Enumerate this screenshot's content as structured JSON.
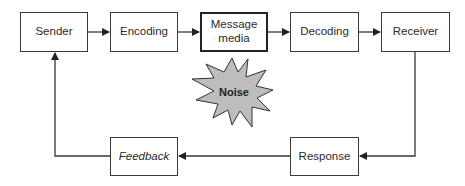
{
  "diagram": {
    "nodes": [
      {
        "id": "sender",
        "label": "Sender"
      },
      {
        "id": "encoding",
        "label": "Encoding"
      },
      {
        "id": "message_media",
        "label": "Message media"
      },
      {
        "id": "decoding",
        "label": "Decoding"
      },
      {
        "id": "receiver",
        "label": "Receiver"
      },
      {
        "id": "response",
        "label": "Response"
      },
      {
        "id": "feedback",
        "label": "Feedback"
      }
    ],
    "noise": {
      "label": "Noise",
      "color": "#bdbdbd"
    },
    "edges": [
      [
        "Sender",
        "Encoding"
      ],
      [
        "Encoding",
        "Message media"
      ],
      [
        "Message media",
        "Decoding"
      ],
      [
        "Decoding",
        "Receiver"
      ],
      [
        "Receiver",
        "Response"
      ],
      [
        "Response",
        "Feedback"
      ],
      [
        "Feedback",
        "Sender"
      ]
    ],
    "colors": {
      "line": "#3a3a3a",
      "box_border": "#3a3a3a",
      "noise_fill": "#bdbdbd",
      "background": "#ffffff"
    }
  }
}
